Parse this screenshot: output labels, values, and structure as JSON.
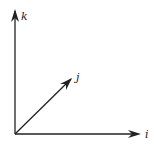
{
  "diagram": {
    "title": "",
    "colors": {
      "stroke": "#222222",
      "background": "#ffffff"
    },
    "origin": [
      15,
      134
    ],
    "axes": [
      {
        "name": "k",
        "label": "k",
        "tip": [
          15,
          9
        ],
        "label_pos": [
          21,
          20
        ]
      },
      {
        "name": "i",
        "label": "i",
        "tip": [
          140,
          134
        ],
        "label_pos": [
          146,
          137
        ]
      },
      {
        "name": "j",
        "label": "j",
        "tip": [
          72,
          78
        ],
        "label_pos": [
          76,
          81
        ]
      }
    ]
  }
}
